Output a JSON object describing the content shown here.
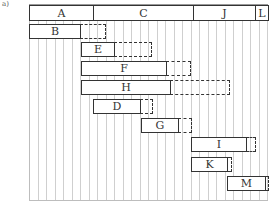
{
  "figure": {
    "corner_label": "a)"
  },
  "header_phases": [
    {
      "label": "A",
      "x": 29,
      "w": 64
    },
    {
      "label": "C",
      "x": 93,
      "w": 100
    },
    {
      "label": "J",
      "x": 193,
      "w": 62
    },
    {
      "label": "L",
      "x": 255,
      "w": 13
    }
  ],
  "activities": [
    {
      "label": "B",
      "x": 29,
      "w": 52,
      "y": 24,
      "slack_end": 106
    },
    {
      "label": "E",
      "x": 81,
      "w": 34,
      "y": 42,
      "slack_end": 152
    },
    {
      "label": "F",
      "x": 81,
      "w": 86,
      "y": 61,
      "slack_end": 191
    },
    {
      "label": "H",
      "x": 81,
      "w": 90,
      "y": 80,
      "slack_end": 230
    },
    {
      "label": "D",
      "x": 93,
      "w": 48,
      "y": 99,
      "slack_end": 153
    },
    {
      "label": "G",
      "x": 141,
      "w": 38,
      "y": 118,
      "slack_end": 192
    },
    {
      "label": "I",
      "x": 191,
      "w": 56,
      "y": 137,
      "slack_end": 256
    },
    {
      "label": "K",
      "x": 191,
      "w": 37,
      "y": 157,
      "slack_end": 232
    },
    {
      "label": "M",
      "x": 227,
      "w": 39,
      "y": 176,
      "slack_end": 269
    }
  ],
  "grid": {
    "x_start": 29,
    "x_end": 268,
    "spacing": 8.5,
    "color": "#cfcfcf"
  }
}
